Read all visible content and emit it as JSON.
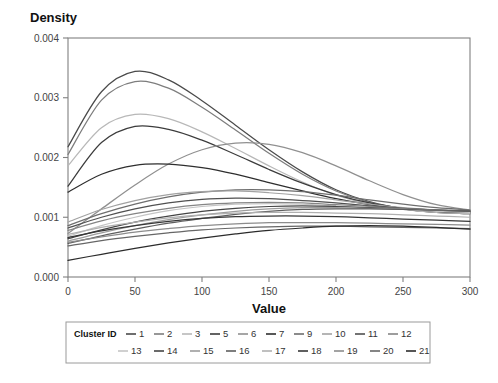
{
  "chart_data": {
    "type": "line",
    "title": "",
    "xlabel": "Value",
    "ylabel": "Density",
    "xlim": [
      0,
      300
    ],
    "ylim": [
      0,
      0.004
    ],
    "xticks": [
      0,
      50,
      100,
      150,
      200,
      250,
      300
    ],
    "yticks": [
      0.0,
      0.001,
      0.002,
      0.003,
      0.004
    ],
    "xtick_labels": [
      "0",
      "50",
      "100",
      "150",
      "200",
      "250",
      "300"
    ],
    "ytick_labels": [
      "0.000",
      "0.001",
      "0.002",
      "0.003",
      "0.004"
    ],
    "grid": false,
    "legend_position": "bottom",
    "legend_title": "Cluster ID",
    "x": [
      0,
      25,
      50,
      75,
      100,
      125,
      150,
      175,
      200,
      225,
      250,
      275,
      300
    ],
    "series": [
      {
        "name": "1",
        "label": "1",
        "color": "#4a4a4a",
        "values": [
          0.00218,
          0.0031,
          0.00344,
          0.0033,
          0.00295,
          0.00254,
          0.00213,
          0.00176,
          0.00146,
          0.00126,
          0.00114,
          0.00108,
          0.00106
        ]
      },
      {
        "name": "2",
        "label": "2",
        "color": "#7d7d7d",
        "values": [
          0.00205,
          0.00296,
          0.00327,
          0.00316,
          0.00284,
          0.00246,
          0.00207,
          0.00172,
          0.00144,
          0.00125,
          0.00114,
          0.00108,
          0.00106
        ]
      },
      {
        "name": "3",
        "label": "3",
        "color": "#b8b8b8",
        "values": [
          0.00186,
          0.0025,
          0.00272,
          0.00265,
          0.00243,
          0.00215,
          0.00186,
          0.00159,
          0.00137,
          0.00122,
          0.00113,
          0.00108,
          0.00106
        ]
      },
      {
        "name": "5",
        "label": "5",
        "color": "#3c3c3c",
        "values": [
          0.00152,
          0.00225,
          0.00252,
          0.00247,
          0.00229,
          0.00205,
          0.0018,
          0.00157,
          0.00138,
          0.00124,
          0.00115,
          0.0011,
          0.00108
        ]
      },
      {
        "name": "6",
        "label": "6",
        "color": "#909090",
        "values": [
          0.00073,
          0.00114,
          0.00154,
          0.00189,
          0.00213,
          0.00224,
          0.00222,
          0.00208,
          0.00186,
          0.00161,
          0.00138,
          0.00121,
          0.00112
        ]
      },
      {
        "name": "7",
        "label": "7",
        "color": "#2e2e2e",
        "values": [
          0.00142,
          0.00172,
          0.00187,
          0.00189,
          0.00183,
          0.00172,
          0.00158,
          0.00144,
          0.00131,
          0.00121,
          0.00114,
          0.0011,
          0.00108
        ]
      },
      {
        "name": "9",
        "label": "9",
        "color": "#6e6e6e",
        "values": [
          0.00086,
          0.00106,
          0.00122,
          0.00134,
          0.00142,
          0.00146,
          0.00146,
          0.00143,
          0.00137,
          0.00129,
          0.00122,
          0.00116,
          0.00112
        ]
      },
      {
        "name": "10",
        "label": "10",
        "color": "#a2a2a2",
        "values": [
          0.00092,
          0.00113,
          0.00128,
          0.00138,
          0.00143,
          0.00144,
          0.00141,
          0.00136,
          0.00129,
          0.00122,
          0.00116,
          0.00112,
          0.0011
        ]
      },
      {
        "name": "11",
        "label": "11",
        "color": "#505050",
        "values": [
          0.00082,
          0.001,
          0.00114,
          0.00124,
          0.0013,
          0.00132,
          0.00131,
          0.00128,
          0.00124,
          0.00119,
          0.00115,
          0.00112,
          0.0011
        ]
      },
      {
        "name": "12",
        "label": "12",
        "color": "#858585",
        "values": [
          0.00078,
          0.00094,
          0.00106,
          0.00115,
          0.00121,
          0.00124,
          0.00125,
          0.00124,
          0.00121,
          0.00118,
          0.00114,
          0.00111,
          0.00109
        ]
      },
      {
        "name": "13",
        "label": "13",
        "color": "#c4c4c4",
        "values": [
          0.00068,
          0.00086,
          0.001,
          0.00111,
          0.00118,
          0.00122,
          0.00123,
          0.00122,
          0.00119,
          0.00116,
          0.00113,
          0.0011,
          0.00108
        ]
      },
      {
        "name": "14",
        "label": "14",
        "color": "#444444",
        "values": [
          0.00064,
          0.00079,
          0.00092,
          0.00102,
          0.0011,
          0.00115,
          0.00118,
          0.00119,
          0.00118,
          0.00116,
          0.00114,
          0.00112,
          0.0011
        ]
      },
      {
        "name": "15",
        "label": "15",
        "color": "#9c9c9c",
        "values": [
          0.0006,
          0.00074,
          0.00086,
          0.00096,
          0.00104,
          0.0011,
          0.00114,
          0.00116,
          0.00116,
          0.00115,
          0.00114,
          0.00112,
          0.00111
        ]
      },
      {
        "name": "16",
        "label": "16",
        "color": "#5e5e5e",
        "values": [
          0.00056,
          0.00069,
          0.0008,
          0.0009,
          0.00098,
          0.00105,
          0.0011,
          0.00113,
          0.00114,
          0.00114,
          0.00113,
          0.00112,
          0.00111
        ]
      },
      {
        "name": "17",
        "label": "17",
        "color": "#b0b0b0",
        "values": [
          0.00071,
          0.00083,
          0.00092,
          0.00099,
          0.00104,
          0.00107,
          0.00108,
          0.00108,
          0.00107,
          0.00106,
          0.00104,
          0.00102,
          0.001
        ]
      },
      {
        "name": "18",
        "label": "18",
        "color": "#373737",
        "values": [
          0.00066,
          0.00077,
          0.00086,
          0.00093,
          0.00098,
          0.00101,
          0.00102,
          0.00102,
          0.00101,
          0.00099,
          0.00097,
          0.00095,
          0.00093
        ]
      },
      {
        "name": "19",
        "label": "19",
        "color": "#8c8c8c",
        "values": [
          0.00058,
          0.00067,
          0.00075,
          0.00081,
          0.00086,
          0.00089,
          0.00091,
          0.00091,
          0.00091,
          0.0009,
          0.00089,
          0.00088,
          0.00087
        ]
      },
      {
        "name": "20",
        "label": "20",
        "color": "#666666",
        "values": [
          0.00052,
          0.00061,
          0.00068,
          0.00074,
          0.00079,
          0.00082,
          0.00084,
          0.00085,
          0.00085,
          0.00084,
          0.00083,
          0.00082,
          0.00081
        ]
      },
      {
        "name": "21",
        "label": "21",
        "color": "#2b2b2b",
        "values": [
          0.00028,
          0.00038,
          0.00048,
          0.00057,
          0.00065,
          0.00072,
          0.00078,
          0.00082,
          0.00085,
          0.00086,
          0.00085,
          0.00083,
          0.0008
        ]
      }
    ]
  },
  "legend": {
    "title": "Cluster ID",
    "row1": [
      "1",
      "2",
      "3",
      "5",
      "6",
      "7",
      "9",
      "10",
      "11",
      "12"
    ],
    "row2": [
      "13",
      "14",
      "15",
      "16",
      "17",
      "18",
      "19",
      "20",
      "21"
    ]
  }
}
